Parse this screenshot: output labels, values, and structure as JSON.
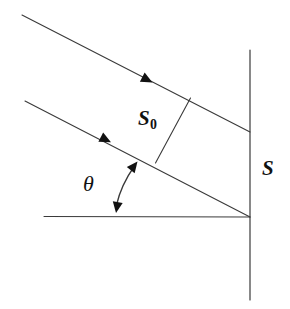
{
  "figure": {
    "background_color": "#ffffff",
    "stroke_color": "#333333",
    "label_color": "#111111",
    "width": 290,
    "height": 309
  },
  "labels": {
    "beam_width": "S",
    "beam_width_subscript": "0",
    "screen_width": "S",
    "angle": "θ"
  },
  "elements": {
    "upper_ray": {
      "name": "upper-beam-ray",
      "x1": 22,
      "y1": 15,
      "x2": 250,
      "y2": 132,
      "arrow_at": {
        "x": 148,
        "y": 80
      }
    },
    "lower_ray": {
      "name": "lower-beam-ray",
      "x1": 25,
      "y1": 101,
      "x2": 250,
      "y2": 217,
      "arrow_at": {
        "x": 107,
        "y": 140
      }
    },
    "horizontal_axis": {
      "name": "horizontal-reference-axis",
      "x1": 44,
      "y1": 216,
      "x2": 250,
      "y2": 217
    },
    "vertical_screen": {
      "name": "vertical-screen-line",
      "x1": 250,
      "y1": 50,
      "x2": 250,
      "y2": 300
    },
    "beam_width_segment": {
      "name": "beam-width-segment",
      "x1": 190,
      "y1": 98,
      "x2": 155,
      "y2": 163
    },
    "angle_arc": {
      "name": "angle-arc",
      "start": {
        "x": 137,
        "y": 162
      },
      "end": {
        "x": 116,
        "y": 211
      },
      "double_headed": true
    },
    "apex": {
      "name": "apex-point",
      "x": 250,
      "y": 217
    }
  }
}
